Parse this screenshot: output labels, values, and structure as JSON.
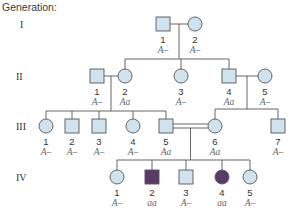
{
  "title": "Generation:",
  "colors": {
    "unaffected_fill": "#cfe3ef",
    "affected_fill": "#5a3a66",
    "outline": "#555555"
  },
  "generations": [
    {
      "label": "I",
      "individuals": [
        {
          "id": "I-1",
          "number": "1",
          "sex": "male",
          "affected": false,
          "genotype": "A–"
        },
        {
          "id": "I-2",
          "number": "2",
          "sex": "female",
          "affected": false,
          "genotype": "A–"
        }
      ]
    },
    {
      "label": "II",
      "individuals": [
        {
          "id": "II-1",
          "number": "1",
          "sex": "male",
          "affected": false,
          "genotype": "A–"
        },
        {
          "id": "II-2",
          "number": "2",
          "sex": "female",
          "affected": false,
          "genotype": "Aa"
        },
        {
          "id": "II-3",
          "number": "3",
          "sex": "female",
          "affected": false,
          "genotype": "A–"
        },
        {
          "id": "II-4",
          "number": "4",
          "sex": "male",
          "affected": false,
          "genotype": "Aa"
        },
        {
          "id": "II-5",
          "number": "5",
          "sex": "female",
          "affected": false,
          "genotype": "A–"
        }
      ]
    },
    {
      "label": "III",
      "individuals": [
        {
          "id": "III-1",
          "number": "1",
          "sex": "female",
          "affected": false,
          "genotype": "A–"
        },
        {
          "id": "III-2",
          "number": "2",
          "sex": "male",
          "affected": false,
          "genotype": "A–"
        },
        {
          "id": "III-3",
          "number": "3",
          "sex": "male",
          "affected": false,
          "genotype": "A–"
        },
        {
          "id": "III-4",
          "number": "4",
          "sex": "female",
          "affected": false,
          "genotype": "A–"
        },
        {
          "id": "III-5",
          "number": "5",
          "sex": "male",
          "affected": false,
          "genotype": "Aa"
        },
        {
          "id": "III-6",
          "number": "6",
          "sex": "female",
          "affected": false,
          "genotype": "Aa"
        },
        {
          "id": "III-7",
          "number": "7",
          "sex": "male",
          "affected": false,
          "genotype": "A–"
        }
      ]
    },
    {
      "label": "IV",
      "individuals": [
        {
          "id": "IV-1",
          "number": "1",
          "sex": "female",
          "affected": false,
          "genotype": "A–"
        },
        {
          "id": "IV-2",
          "number": "2",
          "sex": "male",
          "affected": true,
          "genotype": "aa"
        },
        {
          "id": "IV-3",
          "number": "3",
          "sex": "male",
          "affected": false,
          "genotype": "A–"
        },
        {
          "id": "IV-4",
          "number": "4",
          "sex": "female",
          "affected": true,
          "genotype": "aa"
        },
        {
          "id": "IV-5",
          "number": "5",
          "sex": "female",
          "affected": false,
          "genotype": "A–"
        }
      ]
    }
  ],
  "matings": [
    {
      "partners": [
        "I-1",
        "I-2"
      ],
      "consanguineous": false,
      "children": [
        "II-2",
        "II-3",
        "II-4"
      ]
    },
    {
      "partners": [
        "II-1",
        "II-2"
      ],
      "consanguineous": false,
      "children": [
        "III-1",
        "III-2",
        "III-3",
        "III-4",
        "III-5"
      ]
    },
    {
      "partners": [
        "II-4",
        "II-5"
      ],
      "consanguineous": false,
      "children": [
        "III-6",
        "III-7"
      ]
    },
    {
      "partners": [
        "III-5",
        "III-6"
      ],
      "consanguineous": true,
      "children": [
        "IV-1",
        "IV-2",
        "IV-3",
        "IV-4",
        "IV-5"
      ]
    }
  ]
}
